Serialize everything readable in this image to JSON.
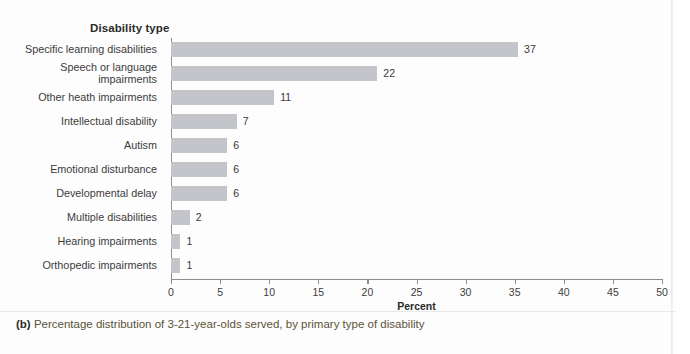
{
  "figure": {
    "column_header": "Disability type",
    "caption_prefix": "(b)",
    "caption_text": "Percentage distribution of 3-21-year-olds served, by primary type of disability"
  },
  "chart_data": {
    "type": "bar",
    "orientation": "horizontal",
    "title": "Disability type",
    "xlabel": "Percent",
    "ylabel": "Disability type",
    "xlim": [
      0,
      50
    ],
    "xticks": [
      0,
      5,
      10,
      15,
      20,
      25,
      30,
      35,
      40,
      45,
      50
    ],
    "xtick_labels": [
      "0",
      "5",
      "10",
      "15",
      "20",
      "25",
      "30",
      "35",
      "40",
      "45",
      "50"
    ],
    "grid": false,
    "legend": false,
    "bar_color": "#c3c5cb",
    "axis_color": "#8b8d92",
    "categories": [
      "Specific learning disabilities",
      "Speech or language\nimpairments",
      "Other heath impairments",
      "Intellectual disability",
      "Autism",
      "Emotional disturbance",
      "Developmental delay",
      "Multiple disabilities",
      "Hearing impairments",
      "Orthopedic impairments"
    ],
    "values": [
      37,
      22,
      11,
      7,
      6,
      6,
      6,
      2,
      1,
      1
    ],
    "data_labels": [
      "37",
      "22",
      "11",
      "7",
      "6",
      "6",
      "6",
      "2",
      "1",
      "1"
    ]
  }
}
